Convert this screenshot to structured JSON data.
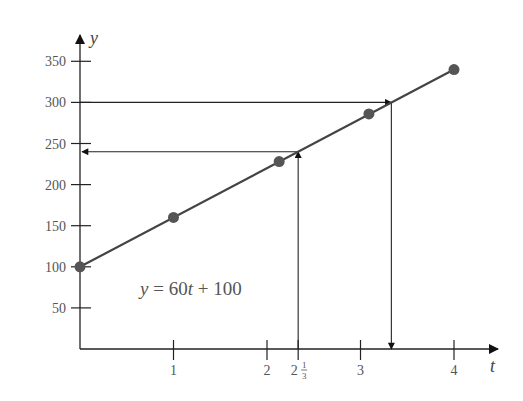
{
  "chart_data": {
    "type": "line",
    "title": "",
    "xlabel": "t",
    "ylabel": "y",
    "equation": "y = 60t + 100",
    "equation_parts": {
      "y": "y",
      "eq": " = 60",
      "t": "t",
      "rest": " + 100"
    },
    "xlim": [
      0,
      4.5
    ],
    "ylim": [
      0,
      380
    ],
    "grid": false,
    "x_ticks": [
      {
        "value": 1,
        "label": "1"
      },
      {
        "value": 2,
        "label": "2"
      },
      {
        "value": 2.3333,
        "label": "2",
        "frac": "1/3"
      },
      {
        "value": 3,
        "label": "3"
      },
      {
        "value": 4,
        "label": "4"
      }
    ],
    "y_ticks": [
      {
        "value": 50,
        "label": "50"
      },
      {
        "value": 100,
        "label": "100"
      },
      {
        "value": 150,
        "label": "150"
      },
      {
        "value": 200,
        "label": "200"
      },
      {
        "value": 250,
        "label": "250"
      },
      {
        "value": 300,
        "label": "300"
      },
      {
        "value": 350,
        "label": "350"
      }
    ],
    "series": [
      {
        "name": "y = 60t + 100",
        "x": [
          0,
          4
        ],
        "y": [
          100,
          340
        ],
        "style": "line"
      },
      {
        "name": "points",
        "x": [
          0,
          1,
          2.13,
          3.09,
          4
        ],
        "y": [
          100,
          160,
          228,
          286,
          340
        ],
        "style": "markers"
      }
    ],
    "annotations": [
      {
        "type": "arrow",
        "description": "horizontal from y-axis at y=300 to line",
        "from": [
          0,
          300
        ],
        "to": [
          3.33,
          300
        ]
      },
      {
        "type": "arrow",
        "description": "vertical from line down to t-axis at t≈3.33",
        "from": [
          3.33,
          300
        ],
        "to": [
          3.33,
          0
        ]
      },
      {
        "type": "arrow",
        "description": "vertical from t-axis at t=2 1/3 up to line",
        "from": [
          2.3333,
          0
        ],
        "to": [
          2.3333,
          240
        ]
      },
      {
        "type": "arrow",
        "description": "horizontal from line left to y-axis at y=240",
        "from": [
          2.3333,
          240
        ],
        "to": [
          0,
          240
        ]
      }
    ],
    "colors": {
      "line": "#444444",
      "marker": "#555555",
      "axis": "#222222"
    }
  }
}
